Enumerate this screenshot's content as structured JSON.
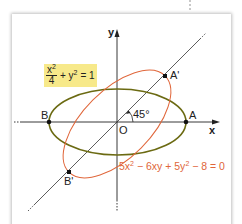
{
  "figure": {
    "axes": {
      "x_label": "x",
      "y_label": "y",
      "origin_label": "O"
    },
    "points": [
      {
        "label": "A",
        "x": 186,
        "y": 122
      },
      {
        "label": "B",
        "x": 49,
        "y": 122
      },
      {
        "label": "A'",
        "x": 165,
        "y": 76
      },
      {
        "label": "B'",
        "x": 69,
        "y": 172
      }
    ],
    "angle_label": "45°",
    "ellipse1": {
      "equation_num": "x",
      "equation_num_sup": "2",
      "equation_den": "4",
      "equation_rest": "+ y",
      "equation_rest_sup": "2",
      "equation_tail": "= 1",
      "color": "#6b6a12",
      "label_bg": "#f7e98a"
    },
    "ellipse2": {
      "equation_parts": [
        "5x",
        "2",
        " − 6xy + 5y",
        "2",
        " − 8 = 0"
      ],
      "color": "#e0663a"
    }
  }
}
